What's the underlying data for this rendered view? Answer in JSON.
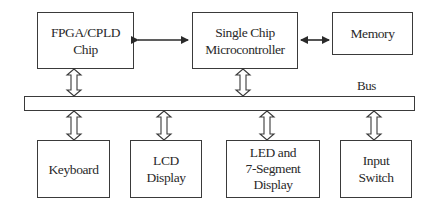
{
  "diagram": {
    "blocks": {
      "fpga": "FPGA/CPLD\nChip",
      "mcu": "Single Chip\nMicrocontroller",
      "memory": "Memory",
      "keyboard": "Keyboard",
      "lcd": "LCD\nDisplay",
      "led": "LED and\n7-Segment\nDisplay",
      "input": "Input\nSwitch"
    },
    "bus_label": "Bus",
    "connections": [
      {
        "from": "FPGA/CPLD Chip",
        "to": "Single Chip Microcontroller",
        "type": "bidirectional-solid"
      },
      {
        "from": "Single Chip Microcontroller",
        "to": "Memory",
        "type": "bidirectional-solid"
      },
      {
        "from": "FPGA/CPLD Chip",
        "to": "Bus",
        "type": "bidirectional-hollow"
      },
      {
        "from": "Single Chip Microcontroller",
        "to": "Bus",
        "type": "bidirectional-hollow"
      },
      {
        "from": "Bus",
        "to": "Keyboard",
        "type": "bidirectional-hollow"
      },
      {
        "from": "Bus",
        "to": "LCD Display",
        "type": "bidirectional-hollow"
      },
      {
        "from": "Bus",
        "to": "LED and 7-Segment Display",
        "type": "bidirectional-hollow"
      },
      {
        "from": "Bus",
        "to": "Input Switch",
        "type": "bidirectional-hollow"
      }
    ]
  }
}
